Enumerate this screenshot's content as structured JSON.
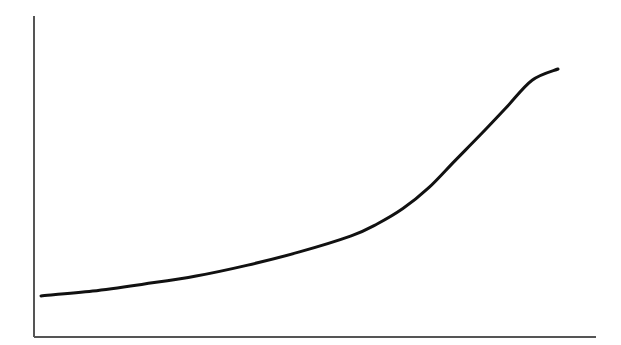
{
  "chart_data": {
    "type": "line",
    "title": "",
    "xlabel": "",
    "ylabel": "",
    "grid": false,
    "legend": null,
    "ticks": {
      "x": [],
      "y": []
    },
    "xlim": [
      0,
      100
    ],
    "ylim": [
      0,
      100
    ],
    "series": [
      {
        "name": "curve",
        "color": "#111111",
        "x": [
          0,
          10,
          20,
          30,
          40,
          50,
          60,
          65,
          70,
          75,
          80,
          85,
          90,
          95,
          100
        ],
        "y": [
          12.8,
          14.3,
          16.5,
          19.0,
          22.4,
          26.5,
          31.5,
          35.2,
          40.0,
          46.5,
          54.8,
          63.0,
          71.5,
          80.0,
          83.5
        ]
      }
    ]
  },
  "style": {
    "axis_color": "#555555",
    "line_color": "#111111",
    "background": "#ffffff"
  },
  "plot_area": {
    "x0": 34,
    "y0": 16,
    "x1": 596,
    "y1": 337,
    "data_x_start": 41,
    "data_x_end": 558
  }
}
